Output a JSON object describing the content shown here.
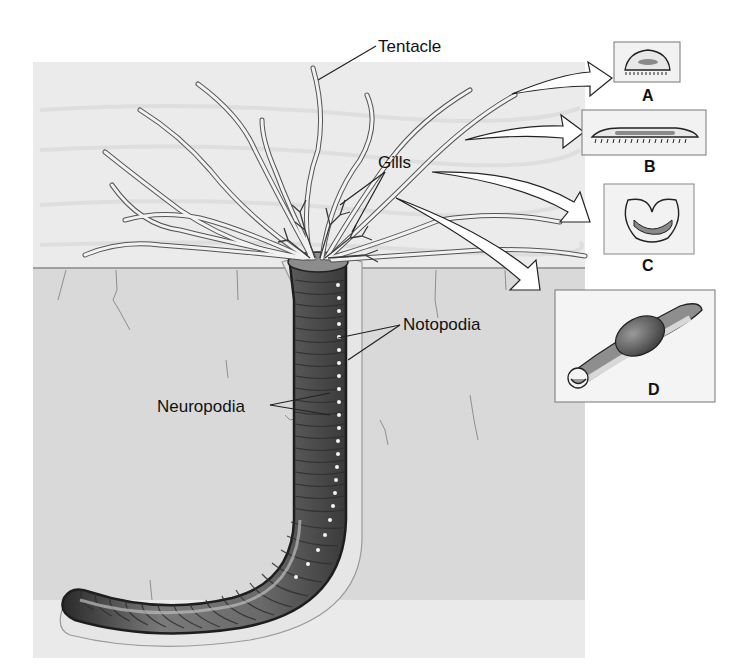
{
  "figure": {
    "colors": {
      "water": "#e9e9e9",
      "sediment": "#d8d8d8",
      "worm_body": "#6e6e6e",
      "worm_dark": "#2a2a2a",
      "tentacle": "#f0f0f0",
      "outline": "#333333",
      "inset_fill": "#f4f4f4",
      "cross_section_inner": "#9a9a9a"
    }
  },
  "labels": {
    "tentacle": "Tentacle",
    "gills": "Gills",
    "notopodia": "Notopodia",
    "neuropodia": "Neuropodia"
  },
  "insets": [
    {
      "id": "A",
      "letter": "A",
      "shape": "dome cross-section with cilia"
    },
    {
      "id": "B",
      "letter": "B",
      "shape": "flattened elongate cross-section with cilia"
    },
    {
      "id": "C",
      "letter": "C",
      "shape": "kidney/U-shaped cross-section"
    },
    {
      "id": "D",
      "letter": "D",
      "shape": "grooved tentacle with particle bolus"
    }
  ]
}
